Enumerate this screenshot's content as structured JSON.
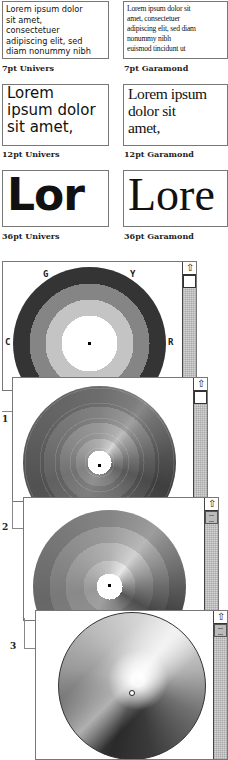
{
  "samples": {
    "univers_7pt": {
      "lines": [
        "Lorem ipsum dolor",
        "sit amet,",
        "consectetuer",
        "adipiscing elit, sed",
        "diam nonummy nibh"
      ],
      "caption": "7pt Univers"
    },
    "garamond_7pt": {
      "lines": [
        "Lorem ipsum dolor sit",
        "amet, consectetuer",
        "adipiscing elit, sed diam",
        "nonummy nibh",
        "euismod tincidunt ut"
      ],
      "caption": "7pt Garamond"
    },
    "univers_12pt": {
      "lines": [
        "Lorem",
        "ipsum dolor",
        "sit amet,"
      ],
      "caption": "12pt Univers"
    },
    "garamond_12pt": {
      "lines": [
        "Lorem ipsum",
        "dolor sit",
        "amet,"
      ],
      "caption": "12pt Garamond"
    },
    "univers_36pt": {
      "text": "Lor",
      "caption": "36pt Univers"
    },
    "garamond_36pt": {
      "text": "Lore",
      "caption": "36pt Garamond"
    }
  },
  "color_wheels": {
    "wheel_0": {
      "labels": {
        "top_left": "G",
        "top_right": "Y",
        "left": "C",
        "right": "R"
      },
      "scroll_up_icon": "⇧",
      "rings": [
        "#3a3a3a",
        "#7a7a7a",
        "#bdbdbd",
        "#ffffff"
      ]
    },
    "wheel_1": {
      "step_label": "1",
      "scroll_up_icon": "⇧"
    },
    "wheel_2": {
      "step_label": "2",
      "scroll_up_icon": "⇧"
    },
    "wheel_3": {
      "step_label": "3",
      "scroll_up_icon": "⇧"
    }
  }
}
